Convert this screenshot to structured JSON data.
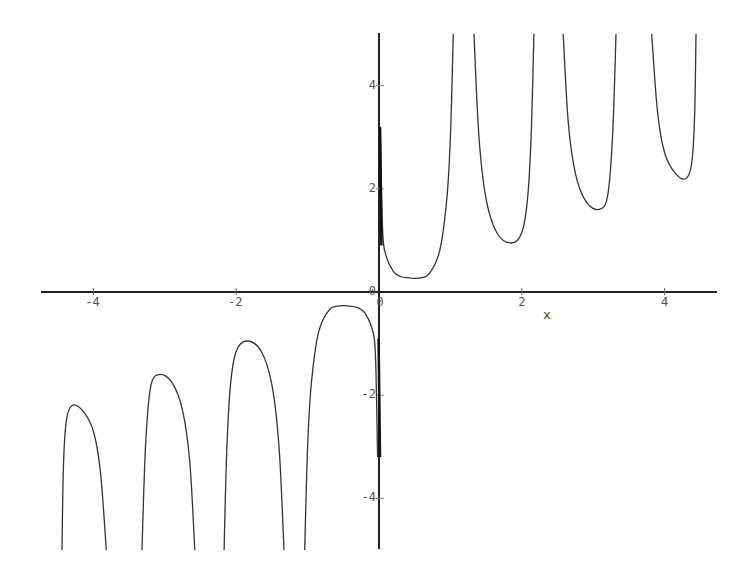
{
  "chart_data": {
    "type": "line",
    "title": "",
    "xlabel": "x",
    "ylabel": "",
    "xlim": [
      -4.8,
      4.7
    ],
    "ylim": [
      -5,
      5
    ],
    "grid": false,
    "legend": null,
    "x_ticks": [
      "-4",
      "-2",
      "0",
      "2",
      "4"
    ],
    "y_ticks": [
      "4",
      "2",
      "0",
      "-2",
      "-4"
    ],
    "x_tick_values": [
      -4,
      -2,
      0,
      2,
      4
    ],
    "y_tick_values": [
      4,
      2,
      0,
      -2,
      -4
    ],
    "color": "#333333",
    "branches": [
      {
        "x": [
          0.02,
          0.05,
          0.1,
          0.2,
          0.3,
          0.45,
          0.55,
          0.7,
          0.85,
          0.95,
          1.0,
          1.04
        ],
        "y": [
          3.2,
          1.2,
          0.7,
          0.4,
          0.3,
          0.27,
          0.27,
          0.35,
          0.8,
          1.8,
          3.0,
          5.0
        ]
      },
      {
        "x": [
          1.33,
          1.4,
          1.5,
          1.65,
          1.85,
          2.0,
          2.08,
          2.13,
          2.17
        ],
        "y": [
          5.0,
          3.0,
          1.8,
          1.15,
          0.95,
          1.15,
          1.8,
          3.0,
          5.0
        ]
      },
      {
        "x": [
          2.58,
          2.65,
          2.75,
          2.9,
          3.08,
          3.2,
          3.27,
          3.32
        ],
        "y": [
          5.0,
          3.3,
          2.3,
          1.75,
          1.6,
          1.85,
          3.0,
          5.0
        ]
      },
      {
        "x": [
          3.82,
          3.9,
          4.0,
          4.15,
          4.3,
          4.38,
          4.42,
          4.44
        ],
        "y": [
          5.0,
          3.5,
          2.7,
          2.3,
          2.2,
          2.5,
          3.4,
          5.0
        ]
      },
      {
        "x": [
          -0.02,
          -0.05,
          -0.1,
          -0.2,
          -0.3,
          -0.45,
          -0.55,
          -0.7,
          -0.85,
          -0.95,
          -1.0,
          -1.04
        ],
        "y": [
          -3.2,
          -1.2,
          -0.7,
          -0.4,
          -0.3,
          -0.27,
          -0.27,
          -0.35,
          -0.8,
          -1.8,
          -3.0,
          -5.0
        ]
      },
      {
        "x": [
          -1.33,
          -1.4,
          -1.5,
          -1.65,
          -1.85,
          -2.0,
          -2.08,
          -2.13,
          -2.17
        ],
        "y": [
          -5.0,
          -3.0,
          -1.8,
          -1.15,
          -0.95,
          -1.15,
          -1.8,
          -3.0,
          -5.0
        ]
      },
      {
        "x": [
          -2.58,
          -2.65,
          -2.75,
          -2.9,
          -3.08,
          -3.2,
          -3.27,
          -3.32
        ],
        "y": [
          -5.0,
          -3.3,
          -2.3,
          -1.75,
          -1.6,
          -1.85,
          -3.0,
          -5.0
        ]
      },
      {
        "x": [
          -3.82,
          -3.9,
          -4.0,
          -4.15,
          -4.3,
          -4.38,
          -4.42,
          -4.44
        ],
        "y": [
          -5.0,
          -3.5,
          -2.7,
          -2.3,
          -2.2,
          -2.5,
          -3.4,
          -5.0
        ]
      }
    ],
    "spike_segments": [
      {
        "x": [
          0.0,
          0.02
        ],
        "y": [
          3.2,
          0.9
        ]
      },
      {
        "x": [
          0.0,
          -0.02
        ],
        "y": [
          -3.2,
          -0.9
        ]
      }
    ]
  }
}
